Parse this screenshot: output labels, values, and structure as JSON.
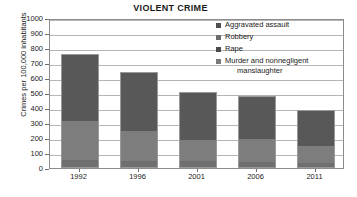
{
  "chart_data": {
    "type": "bar",
    "subtype": "stacked-vertical-bar",
    "title": "VIOLENT CRIME",
    "xlabel": "",
    "ylabel": "Crimes per 100,000 inhabitants",
    "categories": [
      "1992",
      "1996",
      "2001",
      "2006",
      "2011"
    ],
    "ylim": [
      0,
      1000
    ],
    "yticks": [
      0,
      100,
      200,
      300,
      400,
      500,
      600,
      700,
      800,
      900,
      1000
    ],
    "ytick_labels": [
      "0",
      "100",
      "200",
      "300",
      "400",
      "500",
      "600",
      "700",
      "800",
      "900",
      "1000"
    ],
    "grid": "horizontal",
    "legend_position": "top-right",
    "series": [
      {
        "name": "Murder and nonnegligent manslaughter",
        "color": "#4a4a4a",
        "stack_order": 1,
        "values": [
          10,
          8,
          6,
          6,
          5
        ]
      },
      {
        "name": "Rape",
        "color": "#6f6f6f",
        "stack_order": 2,
        "values": [
          45,
          40,
          38,
          34,
          31
        ]
      },
      {
        "name": "Robbery",
        "color": "#7d7d7d",
        "stack_order": 3,
        "values": [
          260,
          197,
          141,
          155,
          114
        ]
      },
      {
        "name": "Aggravated assault",
        "color": "#585858",
        "stack_order": 4,
        "values": [
          443,
          392,
          320,
          285,
          237
        ]
      }
    ],
    "totals": [
      758,
      637,
      505,
      480,
      387
    ]
  },
  "legend": {
    "items": [
      {
        "label": "Aggravated assault",
        "label_line2": "",
        "swatch_class": "sw-assault"
      },
      {
        "label": "Robbery",
        "label_line2": "",
        "swatch_class": "sw-robbery"
      },
      {
        "label": "Rape",
        "label_line2": "",
        "swatch_class": "sw-rape"
      },
      {
        "label": "Murder and nonnegligent",
        "label_line2": "manslaughter",
        "swatch_class": "sw-murder"
      }
    ]
  }
}
